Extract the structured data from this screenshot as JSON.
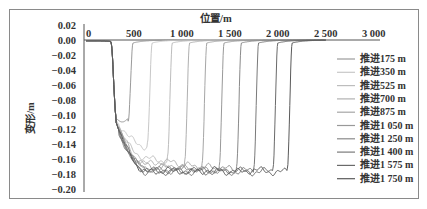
{
  "chart_data": {
    "type": "line",
    "title": "",
    "xlabel": "位置/m",
    "ylabel": "变形/m",
    "xlim": [
      0,
      3000
    ],
    "ylim": [
      -0.2,
      0.02
    ],
    "x_ticks": [
      "0",
      "500",
      "1 000",
      "1 500",
      "2 000",
      "2 500",
      "3 000"
    ],
    "y_ticks": [
      "0.02",
      "0.00",
      "-0.02",
      "-0.04",
      "-0.06",
      "-0.08",
      "-0.10",
      "-0.12",
      "-0.14",
      "-0.16",
      "-0.18",
      "-0.20"
    ],
    "grid": false,
    "legend_position": "right",
    "x_axis_position": "top",
    "series": [
      {
        "name": "推进175 m",
        "color": "#9a9a9a",
        "trough_start": 300,
        "trough_end": 470,
        "min": -0.107
      },
      {
        "name": "推进350 m",
        "color": "#c8c8c8",
        "trough_start": 300,
        "trough_end": 670,
        "min": -0.142
      },
      {
        "name": "推进525 m",
        "color": "#bdbdbd",
        "trough_start": 300,
        "trough_end": 880,
        "min": -0.16
      },
      {
        "name": "推进700 m",
        "color": "#b0b0b0",
        "trough_start": 300,
        "trough_end": 1060,
        "min": -0.165
      },
      {
        "name": "推进875 m",
        "color": "#a6a6a6",
        "trough_start": 300,
        "trough_end": 1240,
        "min": -0.17
      },
      {
        "name": "推进1 050 m",
        "color": "#999999",
        "trough_start": 300,
        "trough_end": 1420,
        "min": -0.172
      },
      {
        "name": "推进1 250 m",
        "color": "#8a8a8a",
        "trough_start": 300,
        "trough_end": 1600,
        "min": -0.174
      },
      {
        "name": "推进1 400 m",
        "color": "#7a7a7a",
        "trough_start": 300,
        "trough_end": 1780,
        "min": -0.176
      },
      {
        "name": "推进1 575 m",
        "color": "#6a6a6a",
        "trough_start": 300,
        "trough_end": 1980,
        "min": -0.176
      },
      {
        "name": "推进1 750 m",
        "color": "#5a5a5a",
        "trough_start": 300,
        "trough_end": 2130,
        "min": -0.176
      }
    ]
  }
}
